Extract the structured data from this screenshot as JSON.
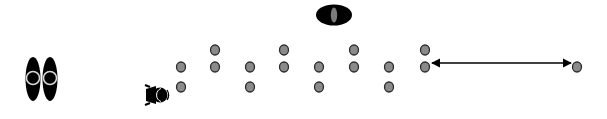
{
  "diagram": {
    "width": 607,
    "height": 119,
    "background": "#ffffff",
    "colors": {
      "dot_fill": "#8a8a8a",
      "dot_stroke": "#2a2a2a",
      "black": "#000000",
      "ring": "#d9d9d9",
      "inner_oval": "#7a7a7a"
    },
    "top_object": {
      "icon": "eye-oval-icon",
      "cx": 334,
      "cy": 15,
      "rx": 18,
      "ry": 10.5
    },
    "left_object": {
      "icon": "double-oval-icon",
      "ovals": [
        {
          "cx": 33,
          "cy": 79,
          "rx": 7.5,
          "ry": 22
        },
        {
          "cx": 50,
          "cy": 79,
          "rx": 7.5,
          "ry": 22
        }
      ]
    },
    "person": {
      "icon": "person-topdown-icon",
      "x": 142,
      "y": 82,
      "w": 28,
      "h": 26,
      "facing": "right"
    },
    "dots": [
      {
        "x": 181,
        "y": 67
      },
      {
        "x": 181,
        "y": 87
      },
      {
        "x": 215,
        "y": 50
      },
      {
        "x": 215,
        "y": 67
      },
      {
        "x": 250,
        "y": 67
      },
      {
        "x": 250,
        "y": 87
      },
      {
        "x": 284,
        "y": 50
      },
      {
        "x": 284,
        "y": 67
      },
      {
        "x": 319,
        "y": 67
      },
      {
        "x": 319,
        "y": 87
      },
      {
        "x": 354,
        "y": 50
      },
      {
        "x": 354,
        "y": 67
      },
      {
        "x": 389,
        "y": 67
      },
      {
        "x": 389,
        "y": 87
      },
      {
        "x": 425,
        "y": 50
      },
      {
        "x": 425,
        "y": 67
      },
      {
        "x": 577,
        "y": 67
      }
    ],
    "dot_radius": {
      "rx": 4.5,
      "ry": 5
    },
    "arrow": {
      "icon": "double-headed-arrow-icon",
      "x1": 432,
      "y1": 63,
      "x2": 571,
      "y2": 63
    }
  }
}
